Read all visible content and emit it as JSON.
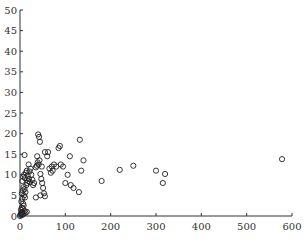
{
  "chart_data": {
    "type": "scatter",
    "title": "",
    "xlabel": "",
    "ylabel": "",
    "xlim": [
      0,
      600
    ],
    "ylim": [
      0,
      50
    ],
    "xticks": [
      0,
      100,
      200,
      300,
      400,
      500,
      600
    ],
    "yticks": [
      0,
      5,
      10,
      15,
      20,
      25,
      30,
      35,
      40,
      45,
      50
    ],
    "grid": false,
    "legend": null,
    "marker": "open-circle",
    "points": [
      [
        0,
        0
      ],
      [
        1,
        0.3
      ],
      [
        2,
        0.5
      ],
      [
        3,
        0.8
      ],
      [
        4,
        0.2
      ],
      [
        5,
        1.0
      ],
      [
        6,
        0.4
      ],
      [
        8,
        0.6
      ],
      [
        10,
        1.2
      ],
      [
        12,
        0.8
      ],
      [
        15,
        1.0
      ],
      [
        2,
        1.5
      ],
      [
        4,
        2.0
      ],
      [
        6,
        1.8
      ],
      [
        8,
        2.5
      ],
      [
        3,
        3.5
      ],
      [
        5,
        4.2
      ],
      [
        7,
        3.0
      ],
      [
        9,
        5.0
      ],
      [
        11,
        4.5
      ],
      [
        4,
        5.5
      ],
      [
        6,
        6.2
      ],
      [
        8,
        7.0
      ],
      [
        10,
        6.5
      ],
      [
        12,
        5.8
      ],
      [
        14,
        7.5
      ],
      [
        16,
        8.0
      ],
      [
        18,
        8.5
      ],
      [
        20,
        9.0
      ],
      [
        22,
        8.2
      ],
      [
        5,
        8.5
      ],
      [
        7,
        9.5
      ],
      [
        9,
        10.0
      ],
      [
        11,
        9.2
      ],
      [
        13,
        10.5
      ],
      [
        15,
        11.0
      ],
      [
        17,
        9.8
      ],
      [
        19,
        12.5
      ],
      [
        21,
        10.8
      ],
      [
        23,
        11.5
      ],
      [
        25,
        10.0
      ],
      [
        27,
        8.8
      ],
      [
        29,
        7.5
      ],
      [
        31,
        8.0
      ],
      [
        10,
        14.8
      ],
      [
        35,
        11.8
      ],
      [
        37,
        12.2
      ],
      [
        39,
        13.0
      ],
      [
        41,
        12.5
      ],
      [
        43,
        13.5
      ],
      [
        45,
        10.2
      ],
      [
        47,
        9.0
      ],
      [
        49,
        8.0
      ],
      [
        51,
        6.8
      ],
      [
        53,
        5.5
      ],
      [
        55,
        4.8
      ],
      [
        35,
        4.5
      ],
      [
        45,
        5.0
      ],
      [
        40,
        19.8
      ],
      [
        42,
        19.2
      ],
      [
        44,
        18.0
      ],
      [
        38,
        14.5
      ],
      [
        48,
        12.0
      ],
      [
        60,
        14.5
      ],
      [
        62,
        15.5
      ],
      [
        65,
        11.5
      ],
      [
        68,
        10.5
      ],
      [
        70,
        12.0
      ],
      [
        72,
        11.0
      ],
      [
        75,
        12.5
      ],
      [
        80,
        12.0
      ],
      [
        55,
        15.5
      ],
      [
        85,
        16.5
      ],
      [
        88,
        17.0
      ],
      [
        90,
        12.5
      ],
      [
        95,
        12.0
      ],
      [
        100,
        8.0
      ],
      [
        105,
        10.0
      ],
      [
        110,
        14.5
      ],
      [
        112,
        7.5
      ],
      [
        118,
        6.8
      ],
      [
        130,
        5.8
      ],
      [
        132,
        18.5
      ],
      [
        135,
        11.0
      ],
      [
        140,
        13.5
      ],
      [
        180,
        8.5
      ],
      [
        220,
        11.2
      ],
      [
        250,
        12.2
      ],
      [
        300,
        11.0
      ],
      [
        315,
        8.0
      ],
      [
        320,
        10.2
      ],
      [
        578,
        13.8
      ]
    ]
  }
}
